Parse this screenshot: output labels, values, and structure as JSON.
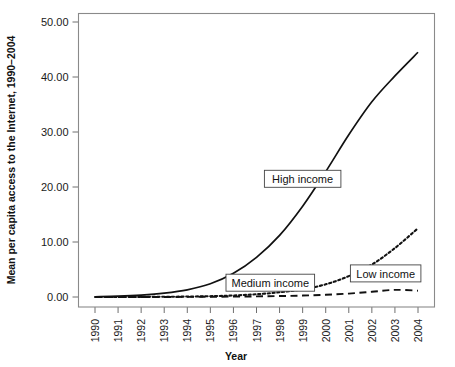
{
  "chart_data": {
    "type": "line",
    "title": "",
    "xlabel": "Year",
    "ylabel": "Mean per capita access to the Internet, 1990–2004",
    "categories": [
      "1990",
      "1991",
      "1992",
      "1993",
      "1994",
      "1995",
      "1996",
      "1997",
      "1998",
      "1999",
      "2000",
      "2001",
      "2002",
      "2003",
      "2004"
    ],
    "x": [
      1990,
      1991,
      1992,
      1993,
      1994,
      1995,
      1996,
      1997,
      1998,
      1999,
      2000,
      2001,
      2002,
      2003,
      2004
    ],
    "xlim": [
      1990,
      2004
    ],
    "ylim": [
      0,
      50
    ],
    "yticks": [
      0,
      10,
      20,
      30,
      40,
      50
    ],
    "ytick_labels": [
      "0.00",
      "10.00",
      "20.00",
      "30.00",
      "40.00",
      "50.00"
    ],
    "grid": false,
    "legend_position": "inline-boxed-annotations",
    "series": [
      {
        "name": "High income",
        "style": "solid",
        "color": "#111111",
        "values": [
          0.05,
          0.15,
          0.35,
          0.7,
          1.3,
          2.4,
          4.3,
          7.2,
          11.2,
          16.5,
          22.8,
          29.5,
          35.5,
          40.2,
          44.5
        ]
      },
      {
        "name": "Medium income",
        "style": "dotted",
        "color": "#111111",
        "values": [
          0.0,
          0.01,
          0.02,
          0.04,
          0.08,
          0.15,
          0.28,
          0.5,
          0.85,
          1.4,
          2.3,
          3.8,
          5.9,
          8.9,
          12.5
        ]
      },
      {
        "name": "Low income",
        "style": "dashed",
        "color": "#111111",
        "values": [
          0.0,
          0.0,
          0.01,
          0.01,
          0.02,
          0.04,
          0.07,
          0.11,
          0.17,
          0.26,
          0.4,
          0.62,
          0.95,
          1.3,
          1.15
        ]
      }
    ],
    "annotations": [
      {
        "text": "High income",
        "x": 1999.0,
        "y": 21.5
      },
      {
        "text": "Medium income",
        "x": 1997.6,
        "y": 2.6
      },
      {
        "text": "Low income",
        "x": 2002.6,
        "y": 4.3
      }
    ]
  }
}
